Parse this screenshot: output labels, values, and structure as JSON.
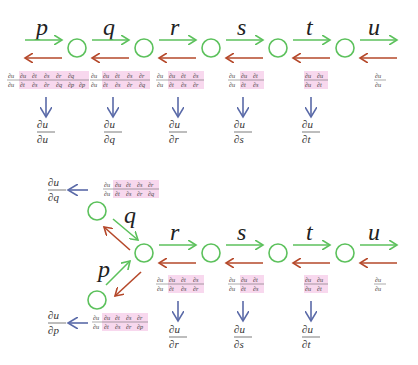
{
  "colors": {
    "forward_arrow": "#5cc15c",
    "backward_arrow": "#b5482a",
    "result_arrow": "#5a6aa8",
    "node": "#5cc15c",
    "highlight": "#f8d8ee"
  },
  "top_chain": {
    "variables": [
      "p",
      "q",
      "r",
      "s",
      "t",
      "u"
    ],
    "local_gradients": [
      {
        "num": [
          "∂u",
          "∂u",
          "∂t",
          "∂s",
          "∂r",
          "∂q"
        ],
        "den": [
          "∂u",
          "∂t",
          "∂s",
          "∂r",
          "∂q",
          "∂p"
        ]
      },
      {
        "num": [
          "∂u",
          "∂u",
          "∂t",
          "∂s",
          "∂r"
        ],
        "den": [
          "∂u",
          "∂t",
          "∂s",
          "∂r",
          "∂q"
        ]
      },
      {
        "num": [
          "∂u",
          "∂u",
          "∂t",
          "∂s"
        ],
        "den": [
          "∂u",
          "∂t",
          "∂s",
          "∂r"
        ]
      },
      {
        "num": [
          "∂u",
          "∂u",
          "∂t"
        ],
        "den": [
          "∂u",
          "∂t",
          "∂s"
        ]
      },
      {
        "num": [
          "∂u",
          "∂u"
        ],
        "den": [
          "∂u",
          "∂t"
        ]
      },
      {
        "num": [
          "∂u"
        ],
        "den": [
          "∂u"
        ]
      }
    ],
    "results": [
      {
        "num": "∂u",
        "den": "∂u"
      },
      {
        "num": "∂u",
        "den": "∂q"
      },
      {
        "num": "∂u",
        "den": "∂r"
      },
      {
        "num": "∂u",
        "den": "∂s"
      },
      {
        "num": "∂u",
        "den": "∂t"
      }
    ]
  },
  "bottom_chain": {
    "branch_variables": [
      "q",
      "p"
    ],
    "variables": [
      "r",
      "s",
      "t",
      "u"
    ],
    "branch_gradients": [
      {
        "num": [
          "∂u",
          "∂u",
          "∂t",
          "∂s",
          "∂r"
        ],
        "den": [
          "∂u",
          "∂t",
          "∂s",
          "∂r",
          "∂q"
        ]
      },
      {
        "num": [
          "∂u",
          "∂u",
          "∂t",
          "∂s",
          "∂r"
        ],
        "den": [
          "∂u",
          "∂t",
          "∂s",
          "∂r",
          "∂p"
        ]
      }
    ],
    "branch_results": [
      {
        "num": "∂u",
        "den": "∂q"
      },
      {
        "num": "∂u",
        "den": "∂p"
      }
    ],
    "local_gradients": [
      {
        "num": [
          "∂u",
          "∂u",
          "∂t",
          "∂s"
        ],
        "den": [
          "∂u",
          "∂t",
          "∂s",
          "∂r"
        ]
      },
      {
        "num": [
          "∂u",
          "∂u",
          "∂t"
        ],
        "den": [
          "∂u",
          "∂t",
          "∂s"
        ]
      },
      {
        "num": [
          "∂u",
          "∂u"
        ],
        "den": [
          "∂u",
          "∂t"
        ]
      },
      {
        "num": [
          "∂u"
        ],
        "den": [
          "∂u"
        ]
      }
    ],
    "results": [
      {
        "num": "∂u",
        "den": "∂r"
      },
      {
        "num": "∂u",
        "den": "∂s"
      },
      {
        "num": "∂u",
        "den": "∂t"
      }
    ]
  }
}
